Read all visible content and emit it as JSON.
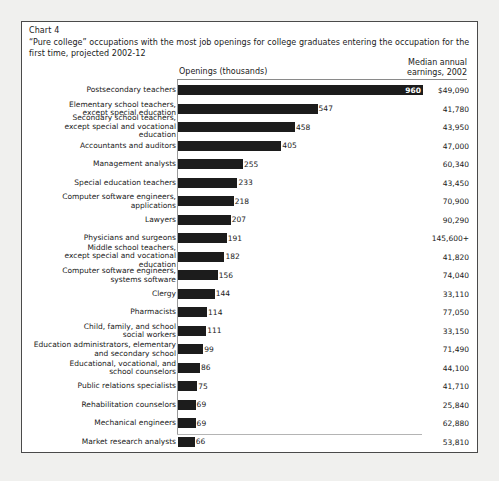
{
  "chart_number": "Chart 4",
  "title": "“Pure college” occupations with the most job openings for college graduates entering the occupation for the first time, projected 2002-12",
  "columns": {
    "openings_header": "Openings (thousands)",
    "earnings_header_line1": "Median annual",
    "earnings_header_line2": "earnings, 2002"
  },
  "chart_data": {
    "type": "bar",
    "orientation": "horizontal",
    "title": "“Pure college” occupations with the most job openings for college graduates entering the occupation for the first time, projected 2002-12",
    "xlabel": "Openings (thousands)",
    "ylabel": "",
    "xlim": [
      0,
      960
    ],
    "grid": false,
    "legend": false,
    "categories": [
      "Postsecondary teachers",
      "Elementary school teachers,\nexcept special education",
      "Secondary school teachers,\nexcept special and vocational education",
      "Accountants and auditors",
      "Management analysts",
      "Special education teachers",
      "Computer software engineers,\napplications",
      "Lawyers",
      "Physicians and surgeons",
      "Middle school teachers,\nexcept special and vocational education",
      "Computer software engineers,\nsystems software",
      "Clergy",
      "Pharmacists",
      "Child, family, and school\nsocial workers",
      "Education administrators, elementary\nand secondary school",
      "Educational, vocational, and\nschool counselors",
      "Public relations specialists",
      "Rehabilitation counselors",
      "Mechanical engineers",
      "Market research analysts"
    ],
    "values": [
      960,
      547,
      458,
      405,
      255,
      233,
      218,
      207,
      191,
      182,
      156,
      144,
      114,
      111,
      99,
      86,
      75,
      69,
      69,
      66
    ],
    "value_labels": [
      "960",
      "547",
      "458",
      "405",
      "255",
      "233",
      "218",
      "207",
      "191",
      "182",
      "156",
      "144",
      "114",
      "111",
      "99",
      "86",
      "75",
      "69",
      "69",
      "66"
    ],
    "earnings_labels": [
      "$49,090",
      "41,780",
      "43,950",
      "47,000",
      "60,340",
      "43,450",
      "70,900",
      "90,290",
      "145,600+",
      "41,820",
      "74,040",
      "33,110",
      "77,050",
      "33,150",
      "71,490",
      "44,100",
      "41,710",
      "25,840",
      "62,880",
      "53,810"
    ],
    "earnings_values": [
      49090,
      41780,
      43950,
      47000,
      60340,
      43450,
      70900,
      90290,
      145600,
      41820,
      74040,
      33110,
      77050,
      33150,
      71490,
      44100,
      41710,
      25840,
      62880,
      53810
    ]
  },
  "colors": {
    "bar": "#1c1c1c",
    "text": "#1a1a1a",
    "frame": "#4a4a4a",
    "background": "#ffffff"
  }
}
